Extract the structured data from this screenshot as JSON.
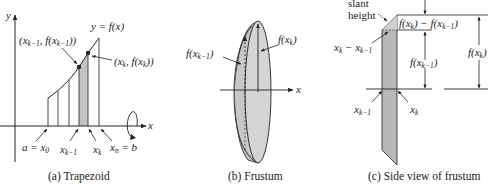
{
  "figure": {
    "panels": [
      {
        "id": "a",
        "caption": "(a) Trapezoid",
        "axis_labels": {
          "y": "y",
          "x": "x"
        },
        "curve_label": "y = f(x)",
        "point_labels": {
          "left": "(x_{k−1}, f(x_{k−1}))",
          "right": "(x_k, f(x_k))"
        },
        "tick_labels": {
          "a": "a = x",
          "a_sub": "0",
          "xkm1": "x",
          "xkm1_sub": "k−1",
          "xk": "x",
          "xk_sub": "k",
          "b": "x",
          "b_sub": "n",
          "b_tail": " = b"
        }
      },
      {
        "id": "b",
        "caption": "(b) Frustum",
        "axis_labels": {
          "x": "x"
        },
        "radius_labels": {
          "left": "f(x",
          "left_sub": "k−1",
          "left_tail": ")",
          "right": "f(x",
          "right_sub": "k",
          "right_tail": ")"
        }
      },
      {
        "id": "c",
        "caption": "(c) Side view of frustum",
        "labels": {
          "slant_1": "slant",
          "slant_2": "height",
          "diff": "f(x",
          "diff_sub1": "k",
          "diff_mid": ") − f(x",
          "diff_sub2": "k−1",
          "diff_tail": ")",
          "width": "x",
          "width_sub1": "k",
          "width_mid": " − x",
          "width_sub2": "k−1",
          "fkm1": "f(x",
          "fkm1_sub": "k−1",
          "fkm1_tail": ")",
          "fk": "f(x",
          "fk_sub": "k",
          "fk_tail": ")",
          "xkm1": "x",
          "xkm1_sub": "k−1",
          "xk": "x",
          "xk_sub": "k"
        }
      }
    ],
    "colors": {
      "line": "#222222",
      "shade": "#c4c4c4",
      "shade_dark": "#a8a8a8",
      "frustum_fill": "#cfcfcf"
    }
  }
}
